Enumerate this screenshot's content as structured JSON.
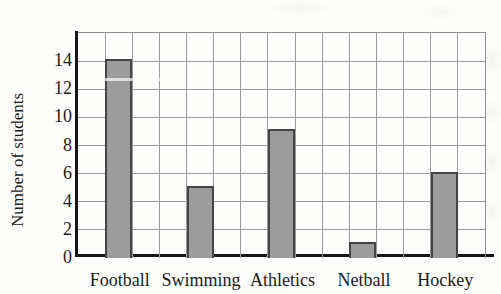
{
  "chart_data": {
    "type": "bar",
    "title": "",
    "xlabel": "",
    "ylabel": "Number of students",
    "categories": [
      "Football",
      "Swimming",
      "Athletics",
      "Netball",
      "Hockey"
    ],
    "values": [
      14,
      5,
      9,
      1,
      6
    ],
    "ylim": [
      0,
      16
    ],
    "ytick_step": 2,
    "ytick_labels": [
      14,
      12,
      10,
      8,
      6,
      4,
      2,
      0
    ],
    "grid": true,
    "legend": "none",
    "layout": {
      "total_columns": 15,
      "first_bar_column": 2,
      "bar_spacing_columns": 3,
      "bar_width_columns": 1
    },
    "colors": {
      "bar_fill": "#9c9c9c",
      "bar_border": "#454545",
      "gridline": "#9b9ba1",
      "gridline_border": "#8d8d94",
      "axis": "#161616",
      "text": "#1b1b1b",
      "background": "#fdfdfb"
    }
  }
}
